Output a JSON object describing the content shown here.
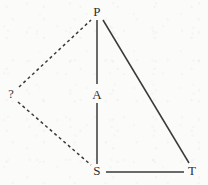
{
  "diagram": {
    "width": 208,
    "height": 185,
    "background_color": "#fbfbfa",
    "stroke_color": "#3a3a3a",
    "solid_stroke_width": 1.5,
    "dashed_stroke_width": 1.5,
    "dash_pattern": "3 3",
    "nodes": [
      {
        "id": "P",
        "label": "P",
        "x": 97,
        "y": 11
      },
      {
        "id": "Q",
        "label": "?",
        "x": 11,
        "y": 94
      },
      {
        "id": "A",
        "label": "A",
        "x": 97,
        "y": 94
      },
      {
        "id": "S",
        "label": "S",
        "x": 97,
        "y": 170
      },
      {
        "id": "T",
        "label": "T",
        "x": 192,
        "y": 170
      }
    ],
    "edges": [
      {
        "id": "P-A",
        "from": "P",
        "to": "A",
        "style": "solid",
        "x1": 97,
        "y1": 20,
        "x2": 97,
        "y2": 84
      },
      {
        "id": "A-S",
        "from": "A",
        "to": "S",
        "style": "solid",
        "x1": 97,
        "y1": 103,
        "x2": 97,
        "y2": 164
      },
      {
        "id": "P-T",
        "from": "P",
        "to": "T",
        "style": "solid",
        "x1": 103,
        "y1": 20,
        "x2": 189,
        "y2": 163
      },
      {
        "id": "S-T",
        "from": "S",
        "to": "T",
        "style": "solid",
        "x1": 106,
        "y1": 172,
        "x2": 184,
        "y2": 172
      },
      {
        "id": "Q-P",
        "from": "?",
        "to": "P",
        "style": "dashed",
        "x1": 19,
        "y1": 87,
        "x2": 91,
        "y2": 20
      },
      {
        "id": "Q-S",
        "from": "?",
        "to": "S",
        "style": "dashed",
        "x1": 18,
        "y1": 102,
        "x2": 91,
        "y2": 165
      }
    ]
  }
}
